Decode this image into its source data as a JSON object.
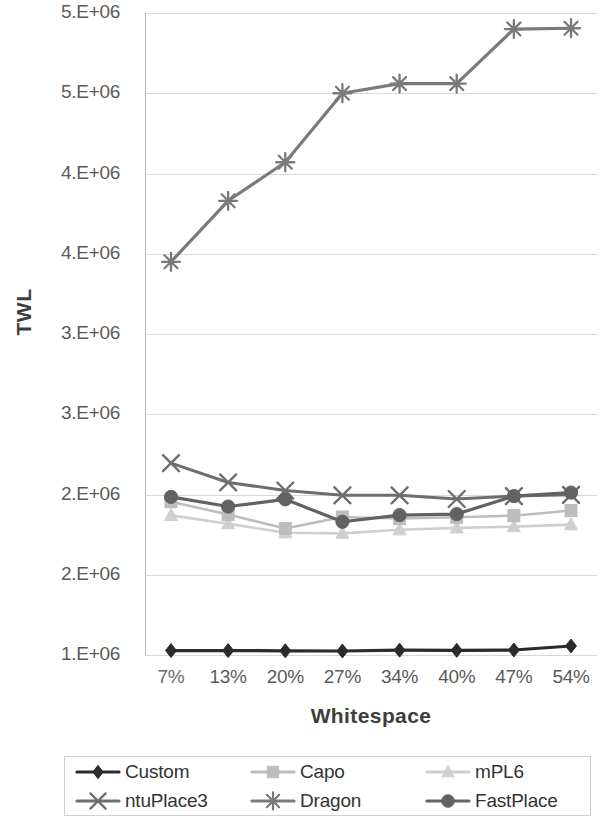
{
  "chart_data": {
    "type": "line",
    "title": "",
    "xlabel": "Whitespace",
    "ylabel": "TWL",
    "categories": [
      "7%",
      "13%",
      "20%",
      "27%",
      "34%",
      "40%",
      "47%",
      "54%"
    ],
    "x_tick_labels": [
      "7%",
      "13%",
      "20%",
      "27%",
      "34%",
      "40%",
      "47%",
      "54%"
    ],
    "y_tick_labels": [
      "5.E+06",
      "5.E+06",
      "4.E+06",
      "4.E+06",
      "3.E+06",
      "3.E+06",
      "2.E+06",
      "2.E+06",
      "1.E+06"
    ],
    "y_tick_values": [
      5500000,
      5000000,
      4500000,
      4000000,
      3500000,
      3000000,
      2500000,
      2000000,
      1000000
    ],
    "ylim": [
      1000000,
      5500000
    ],
    "grid": true,
    "legend_position": "bottom",
    "note_ylabels_truncated": "tenths digit not rendered in source scan",
    "series": [
      {
        "name": "Custom",
        "marker": "diamond",
        "color": "#2b2b2b",
        "line_width": 3.2,
        "values": [
          1055000,
          1055000,
          1052000,
          1050000,
          1060000,
          1058000,
          1062000,
          1112000
        ]
      },
      {
        "name": "Capo",
        "marker": "square",
        "color": "#bdbdbd",
        "line_width": 2.6,
        "values": [
          2455000,
          2375000,
          2288000,
          2360000,
          2350000,
          2358000,
          2368000,
          2400000
        ]
      },
      {
        "name": "mPL6",
        "marker": "triangle",
        "color": "#cfcfcf",
        "line_width": 2.6,
        "values": [
          2370000,
          2318000,
          2262000,
          2258000,
          2280000,
          2292000,
          2300000,
          2312000
        ]
      },
      {
        "name": "ntuPlace3",
        "marker": "x",
        "color": "#6e6e6e",
        "line_width": 3.0,
        "values": [
          2695000,
          2575000,
          2525000,
          2495000,
          2495000,
          2472000,
          2490000,
          2498000
        ]
      },
      {
        "name": "Dragon",
        "marker": "asterisk",
        "color": "#7a7a7a",
        "line_width": 3.2,
        "values": [
          3950000,
          4330000,
          4570000,
          5000000,
          5060000,
          5060000,
          5400000,
          5405000
        ]
      },
      {
        "name": "FastPlace",
        "marker": "circle",
        "color": "#626262",
        "line_width": 3.2,
        "values": [
          2485000,
          2425000,
          2470000,
          2330000,
          2372000,
          2378000,
          2490000,
          2512000
        ]
      }
    ]
  },
  "legend": {
    "items": [
      {
        "label": "Custom",
        "marker": "diamond",
        "color": "#2b2b2b"
      },
      {
        "label": "Capo",
        "marker": "square",
        "color": "#bdbdbd"
      },
      {
        "label": "mPL6",
        "marker": "triangle",
        "color": "#cfcfcf"
      },
      {
        "label": "ntuPlace3",
        "marker": "x",
        "color": "#6e6e6e"
      },
      {
        "label": "Dragon",
        "marker": "asterisk",
        "color": "#7a7a7a"
      },
      {
        "label": "FastPlace",
        "marker": "circle",
        "color": "#626262"
      }
    ]
  },
  "axes": {
    "y_title": "TWL",
    "x_title": "Whitespace"
  }
}
